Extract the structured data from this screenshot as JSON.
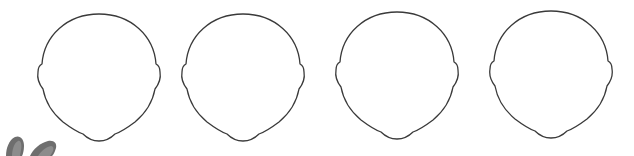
{
  "figure": {
    "description": "Four blank head outline templates",
    "stroke_color": "#3a3a3a",
    "background_color": "#ffffff",
    "heads": [
      {
        "id": "head-1",
        "center_x": 99,
        "top_y": 14
      },
      {
        "id": "head-2",
        "center_x": 243,
        "top_y": 14
      },
      {
        "id": "head-3",
        "center_x": 397,
        "top_y": 12
      },
      {
        "id": "head-4",
        "center_x": 551,
        "top_y": 11
      }
    ],
    "corner_object": {
      "description": "Cropped gray fingertips at bottom-left",
      "color": "#6e6e6e"
    }
  }
}
